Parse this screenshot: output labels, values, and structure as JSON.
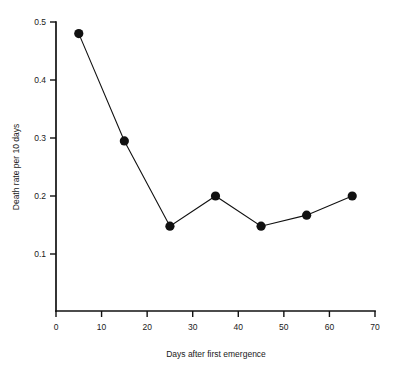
{
  "chart_data": {
    "type": "line",
    "title": "",
    "subtitle": "",
    "xlabel": "Days after first emergence",
    "ylabel": "Death rate per 10 days",
    "xlim": [
      0,
      70
    ],
    "ylim": [
      0,
      0.5
    ],
    "grid": false,
    "legend": null,
    "x_ticks": [
      0,
      10,
      20,
      30,
      40,
      50,
      60,
      70
    ],
    "x_tick_labels": [
      "0",
      "10",
      "20",
      "30",
      "40",
      "50",
      "60",
      "70"
    ],
    "y_ticks": [
      0.1,
      0.2,
      0.3,
      0.4,
      0.5
    ],
    "y_tick_labels": [
      "0.1",
      "0.2",
      "0.3",
      "0.4",
      "0.5"
    ],
    "marker": "filled-circle",
    "marker_color": "#111111",
    "line_color": "#111111",
    "x": [
      5,
      15,
      25,
      35,
      45,
      55,
      65
    ],
    "values": [
      0.48,
      0.295,
      0.148,
      0.2,
      0.148,
      0.167,
      0.2
    ],
    "points": [
      {
        "x": 5,
        "y": 0.48
      },
      {
        "x": 15,
        "y": 0.295
      },
      {
        "x": 25,
        "y": 0.148
      },
      {
        "x": 35,
        "y": 0.2
      },
      {
        "x": 45,
        "y": 0.148
      },
      {
        "x": 55,
        "y": 0.167
      },
      {
        "x": 65,
        "y": 0.2
      }
    ]
  }
}
